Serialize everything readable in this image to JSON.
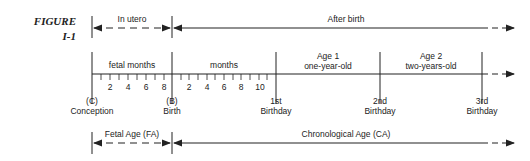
{
  "figure": {
    "label_line1": "FIGURE",
    "label_line2": "I-1"
  },
  "top_row": {
    "in_utero": "In utero",
    "after_birth": "After birth"
  },
  "segments": {
    "fetal_months": "fetal months",
    "months": "months",
    "age1_title": "Age 1",
    "age1_sub": "one-year-old",
    "age2_title": "Age 2",
    "age2_sub": "two-years-old"
  },
  "fetal_ticks": [
    "2",
    "4",
    "6",
    "8"
  ],
  "month_ticks": [
    "2",
    "4",
    "6",
    "8",
    "10"
  ],
  "milestones": {
    "conception_code": "(C)",
    "conception": "Conception",
    "birth_code": "(B)",
    "birth": "Birth",
    "first_1": "1st",
    "second_1": "2nd",
    "third_1": "3rd",
    "birthday": "Birthday"
  },
  "bottom_row": {
    "fetal_age": "Fetal Age (FA)",
    "chronological_age": "Chronological Age (CA)"
  },
  "colors": {
    "line": "#222222"
  }
}
